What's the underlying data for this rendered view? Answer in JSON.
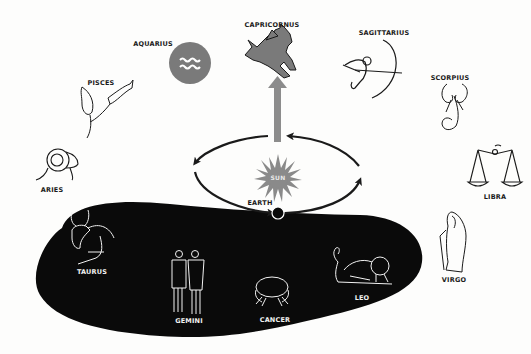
{
  "diagram": {
    "type": "zodiac-orbit",
    "colors": {
      "background": "#fdfdfc",
      "blob": "#0a0a0a",
      "ink": "#1a1a1a",
      "gray_fill": "#7a7a7a",
      "arrow_gray": "#8c8c8c",
      "sun": "#8a8a8a"
    },
    "center": {
      "sun_label": "SUN",
      "earth_label": "EARTH"
    },
    "constellations": [
      {
        "name": "CAPRICORNUS",
        "icon": "sea-goat-icon",
        "position": "top"
      },
      {
        "name": "AQUARIUS",
        "icon": "water-bearer-icon",
        "position": "top-left"
      },
      {
        "name": "SAGITTARIUS",
        "icon": "archer-icon",
        "position": "top-right"
      },
      {
        "name": "PISCES",
        "icon": "fish-icon",
        "position": "left"
      },
      {
        "name": "SCORPIUS",
        "icon": "scorpion-icon",
        "position": "right"
      },
      {
        "name": "ARIES",
        "icon": "ram-icon",
        "position": "left"
      },
      {
        "name": "LIBRA",
        "icon": "scales-icon",
        "position": "right"
      },
      {
        "name": "TAURUS",
        "icon": "bull-icon",
        "position": "bottom-left"
      },
      {
        "name": "GEMINI",
        "icon": "twins-icon",
        "position": "bottom"
      },
      {
        "name": "CANCER",
        "icon": "crab-icon",
        "position": "bottom"
      },
      {
        "name": "LEO",
        "icon": "lion-icon",
        "position": "bottom-right"
      },
      {
        "name": "VIRGO",
        "icon": "maiden-icon",
        "position": "right"
      }
    ]
  }
}
